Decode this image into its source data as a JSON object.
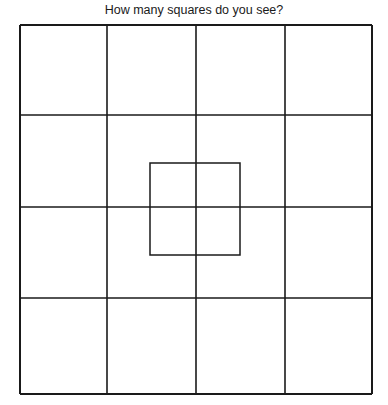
{
  "title": "How many squares do you see?",
  "colors": {
    "line": "#1a1a1a",
    "background": "#ffffff"
  },
  "grid": {
    "rows": 4,
    "cols": 4,
    "x_lines": [
      20,
      107,
      196,
      285,
      372
    ],
    "y_lines": [
      25,
      115,
      207,
      298,
      394
    ]
  },
  "inner_square": {
    "x": 150,
    "y": 163,
    "width": 90,
    "height": 92
  }
}
